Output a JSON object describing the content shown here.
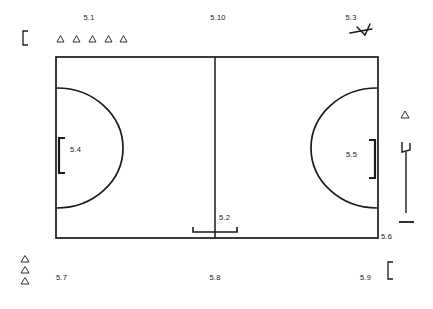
{
  "diagram": {
    "type": "sports-field-schematic",
    "line_color": "#1a1a1a",
    "text_color": "#222222",
    "background_color": "#ffffff",
    "labels": [
      {
        "id": "5.1",
        "text": "5.1",
        "x": 89,
        "y": 18,
        "anchor": "center",
        "refers_to": "row-of-five-triangles-top-left"
      },
      {
        "id": "5.10",
        "text": "5.10",
        "x": 218,
        "y": 18,
        "anchor": "center",
        "refers_to": "centre-line"
      },
      {
        "id": "5.3",
        "text": "5.3",
        "x": 351,
        "y": 18,
        "anchor": "center",
        "refers_to": "arrow-marker-top-right"
      },
      {
        "id": "5.4",
        "text": "5.4",
        "x": 76,
        "y": 148,
        "anchor": "left",
        "refers_to": "left-goal"
      },
      {
        "id": "5.5",
        "text": "5.5",
        "x": 348,
        "y": 156,
        "anchor": "left",
        "refers_to": "right-goal"
      },
      {
        "id": "5.2",
        "text": "5.2",
        "x": 221,
        "y": 219,
        "anchor": "left",
        "refers_to": "substitution-zone"
      },
      {
        "id": "5.6",
        "text": "5.6",
        "x": 383,
        "y": 235,
        "anchor": "left",
        "refers_to": "corner-flag-post"
      },
      {
        "id": "5.7",
        "text": "5.7",
        "x": 57,
        "y": 275,
        "anchor": "left",
        "refers_to": "triangle-stack-bottom-left"
      },
      {
        "id": "5.8",
        "text": "5.8",
        "x": 215,
        "y": 275,
        "anchor": "center",
        "refers_to": "outer-goal-line-bottom"
      },
      {
        "id": "5.9",
        "text": "5.9",
        "x": 362,
        "y": 275,
        "anchor": "left",
        "refers_to": "bracket-bottom-right"
      }
    ],
    "field": {
      "left": 56,
      "top": 57,
      "right": 378,
      "bottom": 238,
      "centre_line_x": 215,
      "stroke_width": 1.6
    },
    "goal_area_arcs": {
      "left_arc_radius": 60,
      "right_arc_radius": 60,
      "description": "semicircular goal areas at both ends"
    },
    "goals": {
      "left": {
        "x": 60,
        "y_top": 138,
        "y_bottom": 172,
        "depth": 6,
        "opens": "right"
      },
      "right": {
        "x": 374,
        "y_top": 140,
        "y_bottom": 178,
        "depth": 6,
        "opens": "left"
      }
    },
    "substitution_zone": {
      "x_left": 193,
      "x_right": 237,
      "y": 231,
      "tick_height": 5
    },
    "markers": {
      "triangles_top_row": {
        "count": 5,
        "x_start": 57,
        "x_step": 16,
        "y": 40,
        "size": 6
      },
      "triangles_bottom_stack": {
        "count": 3,
        "x": 25,
        "y_start": 258,
        "y_step": 11,
        "size": 6
      },
      "triangle_right": {
        "x": 405,
        "y": 116,
        "size": 6
      },
      "bracket_top_left": {
        "x": 24,
        "y": 33,
        "height": 13
      },
      "bracket_bottom_right": {
        "x": 388,
        "y": 262,
        "height": 15
      },
      "arrow_top_right": {
        "x": 352,
        "y": 30,
        "description": "small arrowhead / referee signal glyph"
      },
      "corner_flag": {
        "x": 408,
        "y_flag_top": 142,
        "y_pole_bottom": 213,
        "y_base": 222
      }
    }
  }
}
